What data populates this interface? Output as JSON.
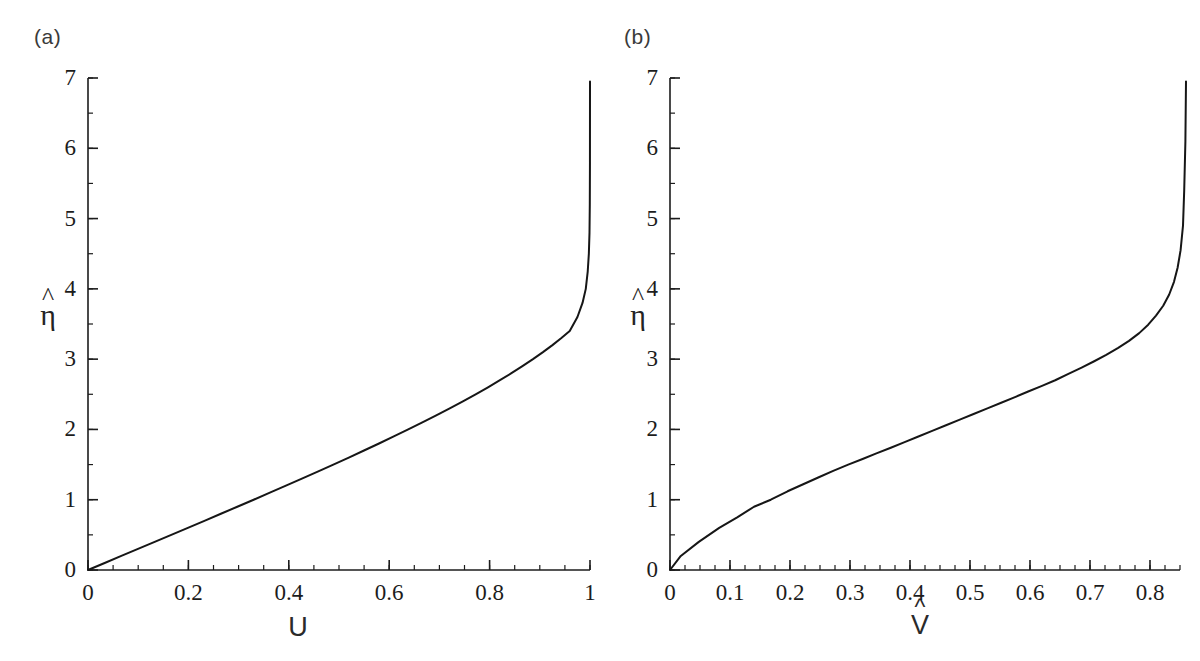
{
  "figure": {
    "width": 1200,
    "height": 661,
    "background": "#ffffff",
    "line_color": "#161616",
    "axis_color": "#1c1c1c"
  },
  "panels": [
    {
      "id": "a",
      "label": "(a)",
      "xlabel": "U",
      "xlabel_has_hat": false,
      "ylabel": "η",
      "ylabel_has_hat": true,
      "xticks": [
        "0",
        "0.2",
        "0.4",
        "0.6",
        "0.8",
        "1"
      ],
      "xtick_values": [
        0,
        0.2,
        0.4,
        0.6,
        0.8,
        1
      ],
      "yticks": [
        "0",
        "1",
        "2",
        "3",
        "4",
        "5",
        "6",
        "7"
      ],
      "ytick_values": [
        0,
        1,
        2,
        3,
        4,
        5,
        6,
        7
      ],
      "xlim": [
        0,
        1.0
      ],
      "ylim": [
        0,
        7
      ],
      "minor_x_step": 0.05,
      "minor_y_step": 0.5
    },
    {
      "id": "b",
      "label": "(b)",
      "xlabel": "V",
      "xlabel_has_hat": true,
      "ylabel": "η",
      "ylabel_has_hat": true,
      "xticks": [
        "0",
        "0.1",
        "0.2",
        "0.3",
        "0.4",
        "0.5",
        "0.6",
        "0.7",
        "0.8"
      ],
      "xtick_values": [
        0,
        0.1,
        0.2,
        0.3,
        0.4,
        0.5,
        0.6,
        0.7,
        0.8
      ],
      "yticks": [
        "0",
        "1",
        "2",
        "3",
        "4",
        "5",
        "6",
        "7"
      ],
      "ytick_values": [
        0,
        1,
        2,
        3,
        4,
        5,
        6,
        7
      ],
      "xlim": [
        0,
        0.85
      ],
      "ylim": [
        0,
        7
      ],
      "minor_x_step": 0.025,
      "minor_y_step": 0.5
    }
  ],
  "chart_data": [
    {
      "type": "line",
      "panel": "a",
      "title": "(a)",
      "xlabel": "U",
      "ylabel": "eta-hat",
      "xlim": [
        0,
        1.0
      ],
      "ylim": [
        0,
        7
      ],
      "grid": false,
      "legend": "none",
      "description": "Blasius-type streamwise velocity profile: eta-hat increases nearly linearly with U for small U, then diverges as U approaches 1.",
      "x": [
        0.0,
        0.0332,
        0.0664,
        0.0996,
        0.1328,
        0.1659,
        0.1989,
        0.2319,
        0.2647,
        0.2974,
        0.33,
        0.3623,
        0.3943,
        0.4261,
        0.4576,
        0.4887,
        0.5195,
        0.5498,
        0.5797,
        0.6091,
        0.6379,
        0.6661,
        0.6937,
        0.7206,
        0.7468,
        0.7722,
        0.7968,
        0.8206,
        0.8435,
        0.8654,
        0.8864,
        0.9063,
        0.9252,
        0.943,
        0.9596,
        0.975,
        0.9851,
        0.9916,
        0.9955,
        0.9977,
        0.999,
        0.9996,
        0.9999,
        1.0
      ],
      "y": [
        0.0,
        0.1,
        0.2,
        0.3,
        0.4,
        0.5,
        0.6,
        0.7,
        0.8,
        0.9,
        1.0,
        1.1,
        1.2,
        1.3,
        1.4,
        1.5,
        1.6,
        1.7,
        1.8,
        1.9,
        2.0,
        2.1,
        2.2,
        2.3,
        2.4,
        2.5,
        2.6,
        2.7,
        2.8,
        2.9,
        3.0,
        3.1,
        3.2,
        3.3,
        3.4,
        3.6,
        3.8,
        4.0,
        4.25,
        4.5,
        4.8,
        5.2,
        5.8,
        6.95
      ]
    },
    {
      "type": "line",
      "panel": "b",
      "title": "(b)",
      "xlabel": "V-hat",
      "ylabel": "eta-hat",
      "xlim": [
        0,
        0.85
      ],
      "ylim": [
        0,
        7
      ],
      "grid": false,
      "legend": "none",
      "description": "Blasius-type wall-normal velocity profile: eta-hat rises steeply (square-root-like) at small V-hat, grows nearly linearly through mid-range, then diverges as V-hat approaches about 0.86.",
      "x": [
        0.0,
        0.018,
        0.048,
        0.082,
        0.112,
        0.14,
        0.168,
        0.196,
        0.222,
        0.248,
        0.272,
        0.297,
        0.321,
        0.344,
        0.368,
        0.391,
        0.414,
        0.437,
        0.46,
        0.483,
        0.506,
        0.529,
        0.552,
        0.575,
        0.597,
        0.62,
        0.642,
        0.664,
        0.686,
        0.707,
        0.727,
        0.747,
        0.765,
        0.782,
        0.797,
        0.81,
        0.822,
        0.832,
        0.84,
        0.846,
        0.851,
        0.855,
        0.857,
        0.859,
        0.86
      ],
      "y": [
        0.0,
        0.2,
        0.4,
        0.6,
        0.75,
        0.9,
        1.0,
        1.12,
        1.22,
        1.32,
        1.41,
        1.5,
        1.58,
        1.66,
        1.74,
        1.82,
        1.9,
        1.98,
        2.06,
        2.14,
        2.22,
        2.3,
        2.38,
        2.46,
        2.54,
        2.62,
        2.7,
        2.79,
        2.88,
        2.97,
        3.06,
        3.16,
        3.26,
        3.37,
        3.49,
        3.62,
        3.76,
        3.92,
        4.1,
        4.3,
        4.55,
        4.9,
        5.4,
        6.1,
        6.95
      ]
    }
  ]
}
